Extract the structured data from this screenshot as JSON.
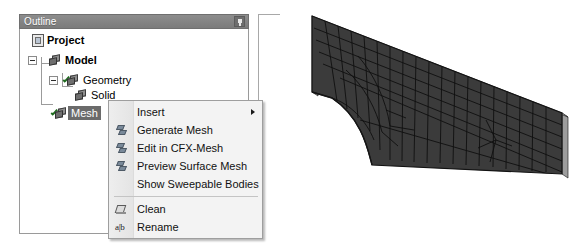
{
  "panel": {
    "title": "Outline",
    "pin_icon": "pin-icon",
    "title_bg": "#7f7f7f",
    "title_fg": "#ffffff"
  },
  "tree": {
    "items": [
      {
        "label": "Project",
        "icon": "document-icon",
        "bold": true,
        "expander": null,
        "selected": false,
        "indent": 0
      },
      {
        "label": "Model",
        "icon": "cube-icon",
        "bold": true,
        "expander": "collapse",
        "selected": false,
        "indent": 1
      },
      {
        "label": "Geometry",
        "icon": "cube-check-icon",
        "bold": false,
        "expander": "collapse",
        "selected": false,
        "indent": 2
      },
      {
        "label": "Solid",
        "icon": "cube-icon",
        "bold": false,
        "expander": null,
        "selected": false,
        "indent": 3
      },
      {
        "label": "Mesh",
        "icon": "cube-check-icon",
        "bold": false,
        "expander": null,
        "selected": true,
        "indent": 2
      }
    ],
    "selection_bg": "#6b6b6b",
    "selection_fg": "#ffffff"
  },
  "context_menu": {
    "items": [
      {
        "label": "Insert",
        "icon": null,
        "submenu": true,
        "separator_after": false
      },
      {
        "label": "Generate Mesh",
        "icon": "mesh-icon",
        "submenu": false,
        "separator_after": false
      },
      {
        "label": "Edit in CFX-Mesh",
        "icon": "mesh-icon",
        "submenu": false,
        "separator_after": false
      },
      {
        "label": "Preview Surface Mesh",
        "icon": "mesh-icon",
        "submenu": false,
        "separator_after": false
      },
      {
        "label": "Show Sweepable Bodies",
        "icon": null,
        "submenu": false,
        "separator_after": true
      },
      {
        "label": "Clean",
        "icon": "eraser-icon",
        "submenu": false,
        "separator_after": false
      },
      {
        "label": "Rename",
        "icon": "rename-ab-icon",
        "submenu": false,
        "separator_after": false
      }
    ]
  },
  "viewport": {
    "name": "3d-mesh-view",
    "marker": "crosshair-marker",
    "mesh_face_color": "#3b3b3b",
    "mesh_edge_color": "#111111",
    "mesh_side_color": "#9a9a9a",
    "background": "#ffffff"
  }
}
